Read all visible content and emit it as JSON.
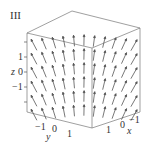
{
  "panel_label": "III",
  "axes": {
    "z": {
      "label": "z",
      "ticks": [
        "1",
        "0",
        "−1"
      ]
    },
    "y": {
      "label": "y",
      "ticks": [
        "−1",
        "0",
        "1"
      ]
    },
    "x": {
      "label": "x",
      "ticks": [
        "1",
        "0",
        "−1"
      ]
    }
  },
  "colors": {
    "arrow": "#555555",
    "box": "#666666"
  },
  "chart_data": {
    "type": "vector-field-3d",
    "title": "III",
    "xlabel": "x",
    "ylabel": "y",
    "zlabel": "z",
    "xlim": [
      -1.5,
      1.5
    ],
    "ylim": [
      -1.5,
      1.5
    ],
    "zlim": [
      -2,
      2
    ]
  }
}
